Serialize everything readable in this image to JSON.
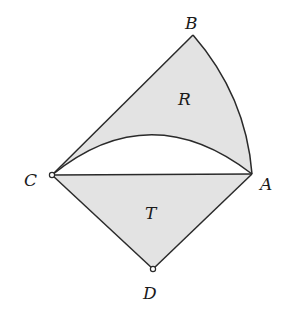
{
  "diagram": {
    "points": {
      "A": {
        "label": "A",
        "x": 252,
        "y": 174
      },
      "B": {
        "label": "B",
        "x": 193,
        "y": 35
      },
      "C": {
        "label": "C",
        "x": 52,
        "y": 175
      },
      "D": {
        "label": "D",
        "x": 153,
        "y": 269
      }
    },
    "regions": {
      "R": {
        "label": "R"
      },
      "T": {
        "label": "T"
      }
    },
    "colors": {
      "fill": "#e3e3e3",
      "stroke": "#2a2a2a",
      "background": "#ffffff"
    }
  }
}
